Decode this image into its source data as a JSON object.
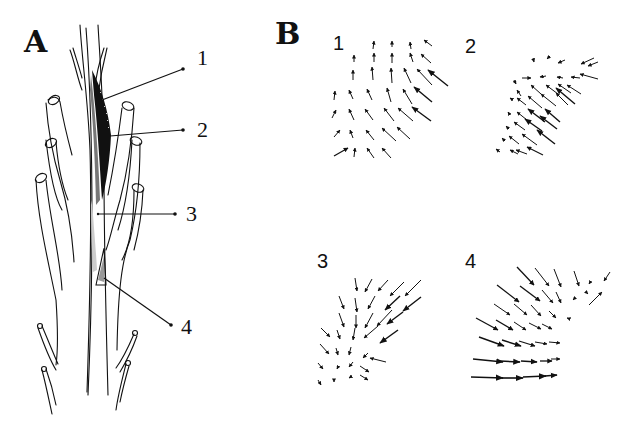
{
  "figure": {
    "panel_a": {
      "letter": "A",
      "description": "Shoot tip with leaf primordia and stem; numbered regions along stem",
      "labels": [
        {
          "id": "1",
          "text": "1"
        },
        {
          "id": "2",
          "text": "2"
        },
        {
          "id": "3",
          "text": "3"
        },
        {
          "id": "4",
          "text": "4"
        }
      ]
    },
    "panel_b": {
      "letter": "B",
      "description": "Vector (arrow) fields for regions 1-4",
      "fields": [
        {
          "id": "1",
          "label": "1",
          "direction": "up / up-left, converging upward"
        },
        {
          "id": "2",
          "label": "2",
          "direction": "left / up-left, strongest in center"
        },
        {
          "id": "3",
          "label": "3",
          "direction": "down / down-left, converging to lower-left"
        },
        {
          "id": "4",
          "label": "4",
          "direction": "down-right / right, strongest at bottom-left"
        }
      ]
    }
  }
}
